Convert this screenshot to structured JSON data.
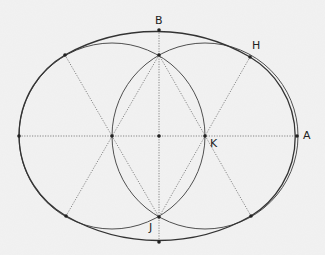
{
  "diagram": {
    "type": "four-center oval construction",
    "background": "#f2f2f2",
    "line_color": "#3a3a3a",
    "guide_color": "#6a6a6a",
    "labels": {
      "B": "B",
      "H": "H",
      "A": "A",
      "K": "K",
      "J": "J"
    },
    "points": {
      "O": [
        159,
        136
      ],
      "P_left": [
        112,
        136
      ],
      "K": [
        205,
        136
      ],
      "P_top": [
        159,
        55
      ],
      "J": [
        159,
        217
      ],
      "B": [
        159,
        30
      ],
      "bottom": [
        159,
        242
      ],
      "A": [
        297,
        136
      ],
      "left": [
        19,
        136
      ],
      "H": [
        250,
        57
      ],
      "upper_left": [
        65,
        55
      ],
      "lower_left": [
        66,
        216
      ],
      "lower_right": [
        251,
        216
      ]
    }
  }
}
